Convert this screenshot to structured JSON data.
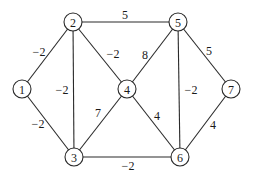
{
  "diagram": {
    "type": "weighted-undirected-graph",
    "nodes": [
      {
        "id": "1",
        "label": "1",
        "x": 22,
        "y": 89
      },
      {
        "id": "2",
        "label": "2",
        "x": 73,
        "y": 22
      },
      {
        "id": "3",
        "label": "3",
        "x": 74,
        "y": 157
      },
      {
        "id": "4",
        "label": "4",
        "x": 127,
        "y": 89
      },
      {
        "id": "5",
        "label": "5",
        "x": 178,
        "y": 22
      },
      {
        "id": "6",
        "label": "6",
        "x": 180,
        "y": 157
      },
      {
        "id": "7",
        "label": "7",
        "x": 231,
        "y": 89
      }
    ],
    "edges": [
      {
        "from": "1",
        "to": "2",
        "weight": "−2",
        "lx": 39,
        "ly": 52
      },
      {
        "from": "1",
        "to": "3",
        "weight": "−2",
        "lx": 38,
        "ly": 124
      },
      {
        "from": "2",
        "to": "3",
        "weight": "−2",
        "lx": 62,
        "ly": 90
      },
      {
        "from": "2",
        "to": "4",
        "weight": "−2",
        "lx": 113,
        "ly": 54
      },
      {
        "from": "2",
        "to": "5",
        "weight": "5",
        "lx": 125,
        "ly": 15
      },
      {
        "from": "3",
        "to": "4",
        "weight": "7",
        "lx": 98,
        "ly": 113
      },
      {
        "from": "3",
        "to": "6",
        "weight": "−2",
        "lx": 128,
        "ly": 166
      },
      {
        "from": "4",
        "to": "5",
        "weight": "8",
        "lx": 145,
        "ly": 55
      },
      {
        "from": "4",
        "to": "6",
        "weight": "4",
        "lx": 157,
        "ly": 116
      },
      {
        "from": "5",
        "to": "6",
        "weight": "−2",
        "lx": 191,
        "ly": 90
      },
      {
        "from": "5",
        "to": "7",
        "weight": "5",
        "lx": 209,
        "ly": 51
      },
      {
        "from": "6",
        "to": "7",
        "weight": "4",
        "lx": 213,
        "ly": 125
      }
    ],
    "node_radius": 9,
    "colors": {
      "stroke": "#2a2a2a",
      "text": "#1a1a1a",
      "background": "#ffffff"
    }
  }
}
